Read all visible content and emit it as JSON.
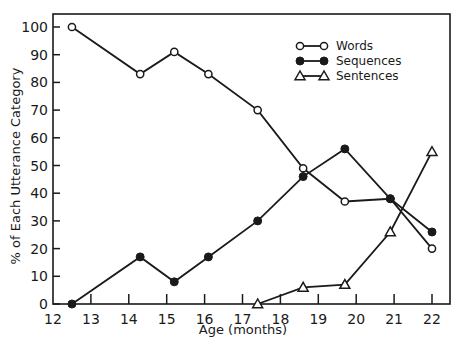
{
  "chart_data": {
    "type": "line",
    "title": "",
    "xlabel": "Age (months)",
    "ylabel": "% of Each Utterance Category",
    "xlim": [
      12,
      22.5
    ],
    "ylim": [
      0,
      105
    ],
    "xticks": [
      12,
      13,
      14,
      15,
      16,
      17,
      18,
      19,
      20,
      21,
      22
    ],
    "yticks": [
      0,
      10,
      20,
      30,
      40,
      50,
      60,
      70,
      80,
      90,
      100
    ],
    "grid": false,
    "legend_position": "upper right",
    "series": [
      {
        "name": "Words",
        "marker": "open-circle",
        "x": [
          12.5,
          14.3,
          15.2,
          16.1,
          17.4,
          18.6,
          19.7,
          20.9,
          22.0
        ],
        "values": [
          100,
          83,
          91,
          83,
          70,
          49,
          37,
          38,
          20
        ]
      },
      {
        "name": "Sequences",
        "marker": "filled-circle",
        "x": [
          12.5,
          14.3,
          15.2,
          16.1,
          17.4,
          18.6,
          19.7,
          20.9,
          22.0
        ],
        "values": [
          0,
          17,
          8,
          17,
          30,
          46,
          56,
          38,
          26
        ]
      },
      {
        "name": "Sentences",
        "marker": "open-triangle",
        "x": [
          17.4,
          18.6,
          19.7,
          20.9,
          22.0
        ],
        "values": [
          0,
          6,
          7,
          26,
          55
        ]
      }
    ]
  },
  "colors": {
    "ink": "#1a1a1a",
    "background": "#ffffff"
  }
}
